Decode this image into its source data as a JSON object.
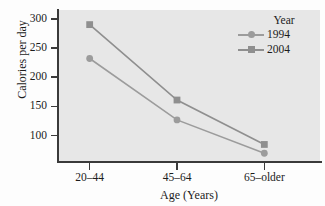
{
  "chart_data": {
    "type": "line",
    "title": "",
    "xlabel": "Age (Years)",
    "ylabel": "Calories per day",
    "categories": [
      "20–44",
      "45–64",
      "65–older"
    ],
    "series": [
      {
        "name": "1994",
        "values": [
          232,
          127,
          70
        ],
        "marker": "circle",
        "color": "#9c9c9c"
      },
      {
        "name": "2004",
        "values": [
          290,
          161,
          85
        ],
        "marker": "square",
        "color": "#8f8f8f"
      }
    ],
    "yticks": [
      100,
      150,
      200,
      250,
      300
    ],
    "ytick_labels": [
      "100",
      "150",
      "200",
      "250",
      "300"
    ],
    "ylim": [
      55,
      315
    ],
    "grid": false,
    "legend": {
      "title": "Year",
      "position": "top-right-outside"
    },
    "plot_background": "#e7e7e7",
    "axis_color": "#3a3a3a"
  },
  "axes": {
    "y_title": "Calories per day",
    "x_title": "Age (Years)",
    "y_labels": [
      "300",
      "250",
      "200",
      "150",
      "100"
    ],
    "x_labels": [
      "20–44",
      "45–64",
      "65–older"
    ]
  },
  "legend": {
    "title": "Year",
    "entries": [
      {
        "label": "1994",
        "marker": "circle-marker-icon"
      },
      {
        "label": "2004",
        "marker": "square-marker-icon"
      }
    ]
  }
}
